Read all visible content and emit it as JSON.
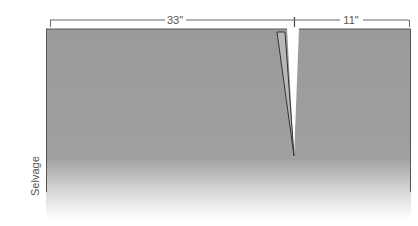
{
  "diagram": {
    "dimensions": [
      {
        "label": "33\"",
        "x1": 50,
        "x2": 294
      },
      {
        "label": "11\"",
        "x1": 294,
        "x2": 409
      }
    ],
    "side_label": "Selvage",
    "colors": {
      "fabric": "#9a9a9a",
      "flap": "#b4b4b4",
      "line": "#444444",
      "text": "#555555",
      "background": "#ffffff"
    }
  }
}
